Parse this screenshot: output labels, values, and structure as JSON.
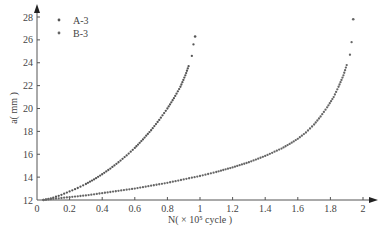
{
  "chart_data": {
    "type": "scatter",
    "title": "",
    "xlabel": "N( × 10⁵ cycle )",
    "ylabel": "a( mm )",
    "xlim": [
      0,
      2
    ],
    "ylim": [
      12,
      28
    ],
    "xticks": [
      0,
      0.2,
      0.4,
      0.6,
      0.8,
      1,
      1.2,
      1.4,
      1.6,
      1.8,
      2
    ],
    "xtick_labels": [
      "0",
      "0.2",
      "0.4",
      "0.6",
      "0.8",
      "1",
      "1.2",
      "1.4",
      "1.6",
      "1.8",
      "2"
    ],
    "yticks": [
      12,
      14,
      16,
      18,
      20,
      22,
      24,
      26,
      28
    ],
    "ytick_labels": [
      "12",
      "14",
      "16",
      "18",
      "20",
      "22",
      "24",
      "26",
      "28"
    ],
    "grid": false,
    "legend_position": "upper-left",
    "series": [
      {
        "name": "A-3",
        "color": "#555555",
        "x": [
          0.04,
          0.1,
          0.15,
          0.2,
          0.25,
          0.3,
          0.35,
          0.4,
          0.45,
          0.5,
          0.55,
          0.6,
          0.65,
          0.7,
          0.75,
          0.8,
          0.84,
          0.88,
          0.91,
          0.93,
          0.95,
          0.96,
          0.97
        ],
        "y": [
          12.0,
          12.2,
          12.45,
          12.75,
          13.05,
          13.4,
          13.8,
          14.25,
          14.75,
          15.3,
          15.9,
          16.55,
          17.3,
          18.1,
          19.0,
          20.0,
          20.9,
          21.9,
          22.9,
          23.7,
          24.6,
          25.6,
          26.3
        ]
      },
      {
        "name": "B-3",
        "color": "#666666",
        "x": [
          0.04,
          0.1,
          0.2,
          0.3,
          0.4,
          0.5,
          0.6,
          0.7,
          0.8,
          0.9,
          1.0,
          1.1,
          1.2,
          1.3,
          1.4,
          1.5,
          1.55,
          1.6,
          1.65,
          1.7,
          1.74,
          1.78,
          1.82,
          1.85,
          1.88,
          1.9,
          1.92,
          1.93,
          1.94
        ],
        "y": [
          12.0,
          12.1,
          12.25,
          12.4,
          12.6,
          12.8,
          13.0,
          13.25,
          13.5,
          13.8,
          14.1,
          14.45,
          14.85,
          15.3,
          15.85,
          16.5,
          16.9,
          17.35,
          17.9,
          18.6,
          19.3,
          20.1,
          21.0,
          21.9,
          22.9,
          23.8,
          24.7,
          25.8,
          27.8
        ]
      }
    ]
  }
}
